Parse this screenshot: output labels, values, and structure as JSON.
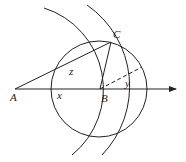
{
  "diagram": {
    "type": "geometric-construction",
    "points": {
      "A": {
        "label": "A",
        "x": 15,
        "y": 89
      },
      "B": {
        "label": "B",
        "x": 100,
        "y": 89
      },
      "C": {
        "label": "C",
        "x": 111,
        "y": 42
      }
    },
    "labels": {
      "A": "A",
      "B": "B",
      "C": "C",
      "x": "x",
      "y": "y",
      "z": "z"
    },
    "circle": {
      "center": "B",
      "radius": 48
    },
    "arcs": [
      {
        "center": "A",
        "through": "B"
      },
      {
        "center": "A",
        "through": "C"
      }
    ],
    "segments": [
      "AC",
      "BC",
      "AB"
    ],
    "ray": {
      "from": "A",
      "direction": "right",
      "arrow": true
    },
    "dashed_segment": {
      "from": "B",
      "to": "circle"
    },
    "colors": {
      "stroke": "#222222",
      "background": "#ffffff"
    }
  }
}
